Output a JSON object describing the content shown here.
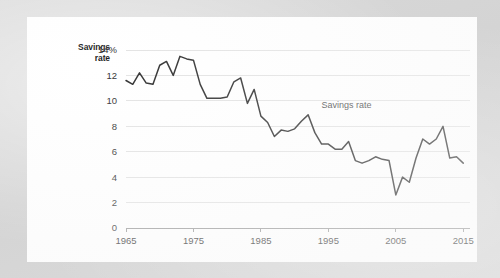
{
  "card": {
    "background_color": "#ffffff",
    "page_background_color": "#d8d8d8"
  },
  "axis_title": {
    "line1": "Savings",
    "line2": "rate"
  },
  "chart_data": {
    "type": "line",
    "title": "",
    "subtitle": "",
    "xlabel": "",
    "ylabel": "Savings rate",
    "xlim": [
      1965,
      2016
    ],
    "ylim": [
      0,
      14
    ],
    "grid": true,
    "grid_axis": "y",
    "legend_position": "inline-annotation",
    "annotations": [
      {
        "text": "Savings rate",
        "x": 1994,
        "y": 9.4
      }
    ],
    "y_ticks": [
      0,
      2,
      4,
      6,
      8,
      10,
      12,
      14
    ],
    "y_tick_labels": [
      "0",
      "2",
      "4",
      "6",
      "8",
      "10",
      "12",
      "14%"
    ],
    "x_ticks": [
      1965,
      1975,
      1985,
      1995,
      2005,
      2015
    ],
    "x_tick_labels": [
      "1965",
      "1975",
      "1985",
      "1995",
      "2005",
      "2015"
    ],
    "line_color": "#2f2f2f",
    "gridline_color": "#e3e3e3",
    "axis_color": "#9a9a9a",
    "series": [
      {
        "name": "Savings rate",
        "x": [
          1965,
          1966,
          1967,
          1968,
          1969,
          1970,
          1971,
          1972,
          1973,
          1974,
          1975,
          1976,
          1977,
          1978,
          1979,
          1980,
          1981,
          1982,
          1983,
          1984,
          1985,
          1986,
          1987,
          1988,
          1989,
          1990,
          1991,
          1992,
          1993,
          1994,
          1995,
          1996,
          1997,
          1998,
          1999,
          2000,
          2001,
          2002,
          2003,
          2004,
          2005,
          2006,
          2007,
          2008,
          2009,
          2010,
          2011,
          2012,
          2013,
          2014,
          2015
        ],
        "values": [
          11.6,
          11.3,
          12.2,
          11.4,
          11.3,
          12.8,
          13.1,
          12.0,
          13.5,
          13.3,
          13.2,
          11.3,
          10.2,
          10.2,
          10.2,
          10.3,
          11.5,
          11.8,
          9.8,
          10.9,
          8.8,
          8.3,
          7.2,
          7.7,
          7.6,
          7.8,
          8.4,
          8.9,
          7.5,
          6.6,
          6.6,
          6.2,
          6.2,
          6.8,
          5.3,
          5.1,
          5.3,
          5.6,
          5.4,
          5.3,
          2.6,
          4.0,
          3.6,
          5.5,
          7.0,
          6.6,
          7.0,
          8.0,
          5.5,
          5.6,
          5.1
        ]
      }
    ]
  }
}
